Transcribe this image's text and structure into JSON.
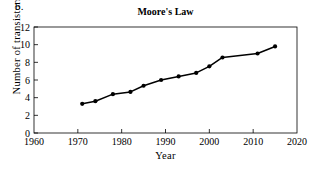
{
  "panel_label": "b.",
  "chart_data": {
    "type": "line",
    "title": "Moore's Law",
    "xlabel": "Year",
    "ylabel": "Number of transistors",
    "xlim": [
      1960,
      2020
    ],
    "ylim": [
      0,
      12
    ],
    "xticks": [
      1960,
      1970,
      1980,
      1990,
      2000,
      2010,
      2020
    ],
    "yticks": [
      0,
      2,
      4,
      6,
      8,
      10,
      12
    ],
    "grid": false,
    "legend": false,
    "marker": "filled-circle",
    "line_color": "#000000",
    "marker_color": "#000000",
    "x": [
      1971,
      1974,
      1978,
      1982,
      1985,
      1989,
      1993,
      1997,
      2000,
      2003,
      2011,
      2015
    ],
    "y": [
      3.3,
      3.6,
      4.4,
      4.65,
      5.35,
      6.0,
      6.4,
      6.8,
      7.55,
      8.55,
      9.0,
      9.8
    ],
    "series": [
      {
        "name": "Number of transistors",
        "points": [
          {
            "x": 1971,
            "y": 3.3
          },
          {
            "x": 1974,
            "y": 3.6
          },
          {
            "x": 1978,
            "y": 4.4
          },
          {
            "x": 1982,
            "y": 4.65
          },
          {
            "x": 1985,
            "y": 5.35
          },
          {
            "x": 1989,
            "y": 6.0
          },
          {
            "x": 1993,
            "y": 6.4
          },
          {
            "x": 1997,
            "y": 6.8
          },
          {
            "x": 2000,
            "y": 7.55
          },
          {
            "x": 2003,
            "y": 8.55
          },
          {
            "x": 2011,
            "y": 9.0
          },
          {
            "x": 2015,
            "y": 9.8
          }
        ]
      }
    ]
  }
}
